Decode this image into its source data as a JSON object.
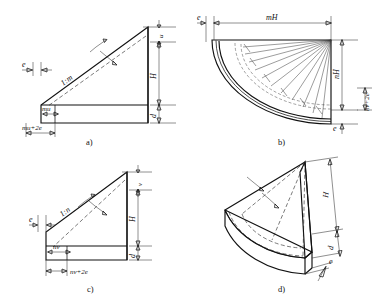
{
  "figure": {
    "background": "#ffffff",
    "line_color": "#111111"
  },
  "panels": [
    {
      "id": "a",
      "label": "a)",
      "slope_label": "1:m",
      "dims": {
        "top_right": "u",
        "height": "H",
        "depth": "d",
        "offset": "e",
        "inner_width": "mu",
        "total_width": "mu+2e"
      }
    },
    {
      "id": "b",
      "label": "b)",
      "dims": {
        "offset_left": "e",
        "top_width": "mH",
        "right_height": "nH",
        "right_small": "nv+2e",
        "offset_bottom": "e"
      }
    },
    {
      "id": "c",
      "label": "c)",
      "slope_label": "1:n",
      "dims": {
        "top_right": "v",
        "height": "H",
        "depth": "d",
        "offset": "e",
        "inner_width": "nv",
        "total_width": "nv+2e"
      }
    },
    {
      "id": "d",
      "label": "d)",
      "dims": {
        "height": "H",
        "depth": "d",
        "offset": "e"
      }
    }
  ]
}
